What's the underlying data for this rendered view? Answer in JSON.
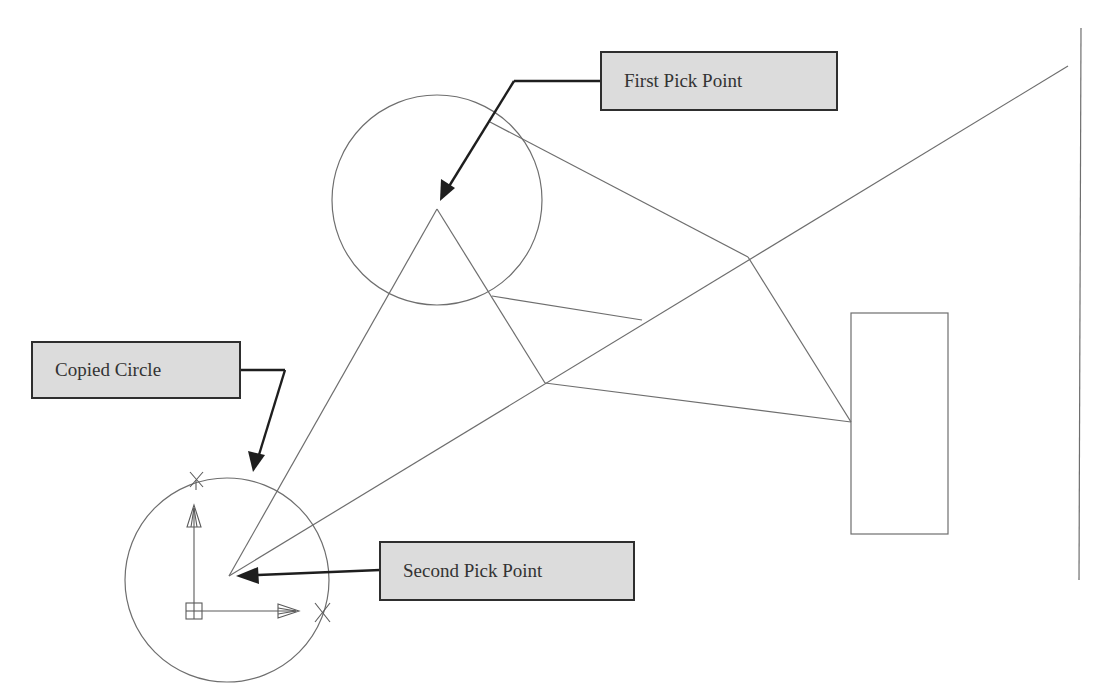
{
  "diagram": {
    "callouts": {
      "first_pick": {
        "label": "First Pick Point"
      },
      "copied_circle": {
        "label": "Copied Circle"
      },
      "second_pick": {
        "label": "Second Pick Point"
      }
    },
    "colors": {
      "geometry_stroke": "#6e6e6e",
      "leader_stroke": "#1e1e1e",
      "callout_fill": "#dcdcdc",
      "callout_border": "#2e2e2e",
      "background": "#ffffff"
    },
    "geometry": {
      "original_circle": {
        "cx": 437,
        "cy": 200,
        "r": 105
      },
      "copied_circle": {
        "cx": 227,
        "cy": 580,
        "r": 102
      },
      "first_pick_point": {
        "x": 437,
        "y": 209
      },
      "second_pick_point": {
        "x": 229,
        "y": 576
      },
      "rectangle": {
        "x": 851,
        "y": 313,
        "width": 97,
        "height": 221
      },
      "vertical_line": {
        "x1": 1081,
        "y1": 28,
        "x2": 1079,
        "y2": 580
      }
    }
  }
}
